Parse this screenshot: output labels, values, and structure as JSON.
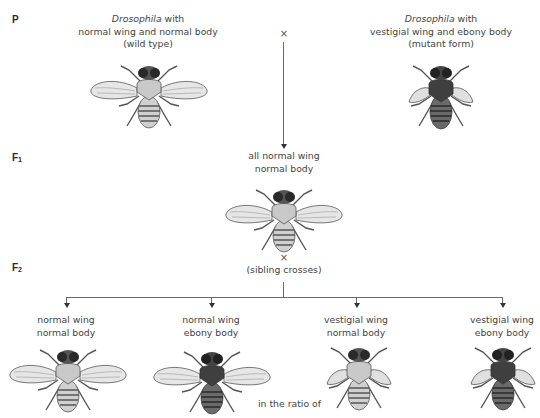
{
  "generations": {
    "p": {
      "label": "P",
      "sub": ""
    },
    "f1": {
      "label": "F",
      "sub": "1"
    },
    "f2": {
      "label": "F",
      "sub": "2"
    }
  },
  "parents": {
    "wild_type": {
      "line1_italic": "Drosophila",
      "line1_rest": " with",
      "line2": "normal wing and normal body",
      "line3": "(wild type)",
      "wing": "normal",
      "body": "normal"
    },
    "mutant": {
      "line1_italic": "Drosophila",
      "line1_rest": " with",
      "line2": "vestigial wing and ebony body",
      "line3": "(mutant form)",
      "wing": "vestigial",
      "body": "ebony"
    },
    "cross_symbol": "×"
  },
  "f1": {
    "line1": "all normal wing",
    "line2": "normal body",
    "cross_symbol": "×",
    "cross_note": "(sibling crosses)"
  },
  "f2": {
    "offspring": [
      {
        "line1": "normal wing",
        "line2": "normal body",
        "wing": "normal",
        "body": "normal"
      },
      {
        "line1": "normal wing",
        "line2": "ebony body",
        "wing": "normal",
        "body": "ebony"
      },
      {
        "line1": "vestigial wing",
        "line2": "normal body",
        "wing": "vestigial",
        "body": "normal"
      },
      {
        "line1": "vestigial wing",
        "line2": "ebony body",
        "wing": "vestigial",
        "body": "ebony"
      }
    ],
    "ratio_text": "in the ratio of"
  },
  "colors": {
    "normal_body": "#c9c9c9",
    "ebony_body": "#4a4a4a",
    "wing": "#e4e4e4",
    "line": "#6a6a6a"
  }
}
